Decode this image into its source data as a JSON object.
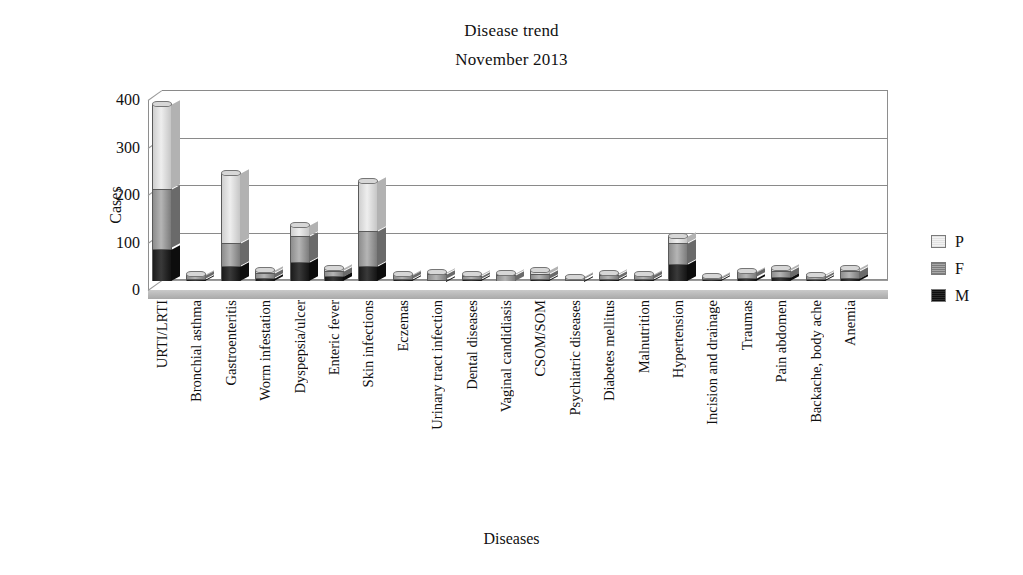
{
  "title": {
    "line1": "Disease trend",
    "line2": "November 2013"
  },
  "axes": {
    "ylabel": "Cases",
    "xlabel": "Diseases",
    "yticks": [
      "0",
      "100",
      "200",
      "300",
      "400"
    ]
  },
  "legend": {
    "position": "right",
    "entries": [
      {
        "key": "P",
        "label": "P",
        "color": "#e2e2e2"
      },
      {
        "key": "F",
        "label": "F",
        "color": "#8d8d8d"
      },
      {
        "key": "M",
        "label": "M",
        "color": "#141414"
      }
    ]
  },
  "chart_data": {
    "type": "bar",
    "subtype": "stacked-3d-column",
    "title": "Disease trend November 2013",
    "xlabel": "Diseases",
    "ylabel": "Cases",
    "ylim": [
      0,
      400
    ],
    "ytick_step": 100,
    "grid": true,
    "legend_position": "right",
    "categories": [
      "URTI/LRTI",
      "Bronchial asthma",
      "Gastroenteritis",
      "Worm infestation",
      "Dyspepsia/ulcer",
      "Enteric fever",
      "Skin infections",
      "Eczemas",
      "Urinary tract infection",
      "Dental diseases",
      "Vaginal candidiasis",
      "CSOM/SOM",
      "Psychiatric diseases",
      "Diabetes mellitus",
      "Malnutrition",
      "Hypertension",
      "Incision and drainage",
      "Traumas",
      "Pain abdomen",
      "Backache, body ache",
      "Anemia"
    ],
    "series": [
      {
        "name": "M",
        "color": "#141414",
        "values": [
          68,
          4,
          32,
          6,
          40,
          10,
          32,
          4,
          3,
          4,
          0,
          4,
          2,
          4,
          4,
          35,
          4,
          7,
          8,
          5,
          6
        ]
      },
      {
        "name": "F",
        "color": "#8d8d8d",
        "values": [
          125,
          8,
          48,
          10,
          55,
          12,
          73,
          8,
          11,
          7,
          13,
          11,
          5,
          9,
          8,
          45,
          4,
          11,
          14,
          6,
          16
        ]
      },
      {
        "name": "P",
        "color": "#e2e2e2",
        "values": [
          179,
          2,
          147,
          7,
          23,
          6,
          105,
          3,
          5,
          3,
          4,
          8,
          2,
          3,
          3,
          15,
          2,
          4,
          6,
          2,
          6
        ]
      }
    ],
    "totals": [
      372,
      14,
      227,
      23,
      118,
      28,
      210,
      15,
      19,
      14,
      17,
      23,
      9,
      16,
      15,
      95,
      10,
      22,
      28,
      13,
      28
    ]
  }
}
